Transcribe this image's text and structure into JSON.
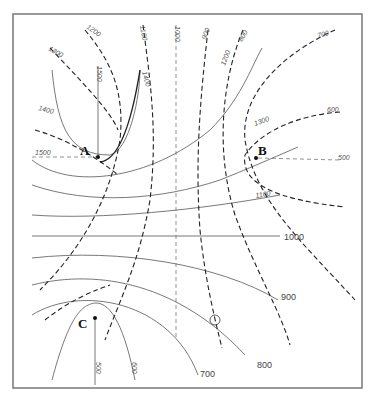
{
  "diagram": {
    "type": "contour-map",
    "points": [
      {
        "id": "A",
        "label": "A"
      },
      {
        "id": "B",
        "label": "B"
      },
      {
        "id": "C",
        "label": "C"
      }
    ],
    "solid_contours": {
      "labels": [
        "1500",
        "1400",
        "1300",
        "1200",
        "1100",
        "1000",
        "900",
        "800",
        "700",
        "600",
        "500"
      ]
    },
    "dashed_contours": {
      "labels": [
        "1300",
        "1200",
        "1100",
        "1000",
        "900",
        "800",
        "700",
        "600",
        "500",
        "1400",
        "1500"
      ]
    },
    "labels": {
      "top_1300": "1300",
      "top_1200": "1200",
      "top_1100": "1100",
      "top_1000": "1000",
      "top_900": "900",
      "top_1200s": "1200",
      "top_800": "800",
      "top_700": "700",
      "right_600": "600",
      "right_1300": "1300",
      "left_1400": "1400",
      "left_1500": "1500",
      "a_1500": "1500",
      "a_1400": "1400",
      "b_500": "500",
      "mid_1100": "1100",
      "mid_1000": "1000",
      "br_900": "900",
      "bot_800": "800",
      "bot_700": "700",
      "c_500": "500",
      "c_600": "600"
    },
    "marked_point": "circled intersection"
  }
}
